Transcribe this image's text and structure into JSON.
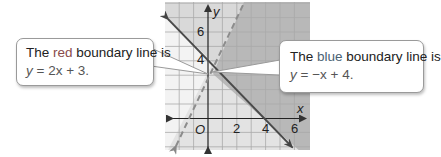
{
  "graph": {
    "x_axis_label": "x",
    "y_axis_label": "y",
    "origin_label": "O",
    "x_tick_labels": [
      "2",
      "4",
      "6"
    ],
    "y_tick_labels": [
      "4",
      "6"
    ],
    "x_range": [
      -3,
      7
    ],
    "y_range": [
      -2,
      8
    ],
    "colors": {
      "unshaded": "#f2f2f2",
      "light_shade": "#dcdcdc",
      "medium_shade": "#e4e4e4",
      "dark_shade": "#b9b9b9",
      "grid": "#b0b0b0",
      "axis": "#222222",
      "red_line": "#8a8a8a",
      "blue_line": "#4a4a4a"
    },
    "lines": [
      {
        "name": "red",
        "equation": "y = 2x + 3",
        "style": "dashed"
      },
      {
        "name": "blue",
        "equation": "y = -x + 4",
        "style": "solid"
      }
    ]
  },
  "callouts": {
    "red": {
      "prefix": "The ",
      "color_word": "red",
      "suffix": " boundary line is",
      "equation_lhs": "y",
      "equation_rhs": " = 2x + 3."
    },
    "blue": {
      "prefix": "The ",
      "color_word": "blue",
      "suffix": " boundary line is",
      "equation_lhs": "y",
      "equation_rhs": " = −x + 4."
    }
  }
}
